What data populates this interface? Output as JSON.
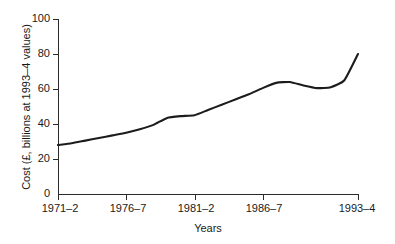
{
  "chart_data": {
    "type": "line",
    "title": "",
    "xlabel": "Years",
    "ylabel": "Cost (£, billions at 1993–4 values)",
    "ylim": [
      0,
      100
    ],
    "yticks": [
      0,
      20,
      40,
      60,
      80,
      100
    ],
    "ytick_labels": [
      "0",
      "20",
      "40",
      "60",
      "80",
      "100"
    ],
    "xtick_labels": [
      "1971–2",
      "1976–7",
      "1981–2",
      "1986–7",
      "1993–4"
    ],
    "xtick_years": [
      1971,
      1976,
      1981,
      1986,
      1993
    ],
    "xlim": [
      1971,
      1993
    ],
    "grid": false,
    "legend": false,
    "series": [
      {
        "name": "Cost",
        "x": [
          1971,
          1972,
          1973,
          1974,
          1975,
          1976,
          1977,
          1978,
          1979,
          1980,
          1981,
          1982,
          1983,
          1984,
          1985,
          1986,
          1987,
          1988,
          1989,
          1990,
          1991,
          1992,
          1993
        ],
        "values": [
          28,
          29,
          30.5,
          32,
          33.5,
          35,
          37,
          39.5,
          43.5,
          44.5,
          45,
          48,
          51,
          54,
          57,
          60.5,
          63.5,
          64,
          62,
          60.5,
          61,
          65,
          80
        ]
      }
    ],
    "line_color": "#1c1c1c",
    "axis_color": "#2a2a2a",
    "background_color": "#ffffff"
  },
  "plot_geometry": {
    "left": 58,
    "right": 358,
    "top": 19,
    "bottom": 194
  }
}
